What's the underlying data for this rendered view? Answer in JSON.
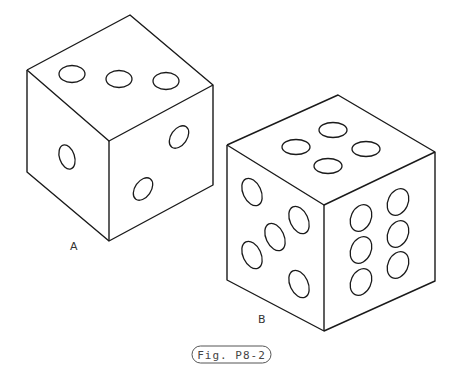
{
  "figure": {
    "caption": "Fig. P8-2",
    "dice": [
      {
        "label": "A",
        "faces": {
          "top": {
            "pips": 3
          },
          "left": {
            "pips": 1
          },
          "right": {
            "pips": 2
          }
        }
      },
      {
        "label": "B",
        "faces": {
          "top": {
            "pips": 4
          },
          "left": {
            "pips": 5
          },
          "right": {
            "pips": 6
          }
        }
      }
    ]
  },
  "colors": {
    "line": "#1a1a1a",
    "background": "#ffffff"
  }
}
